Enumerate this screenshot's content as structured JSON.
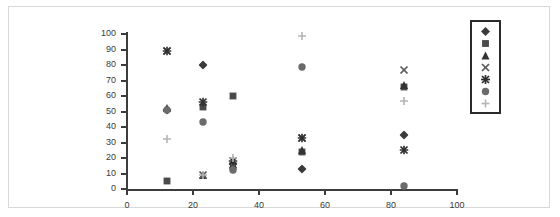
{
  "chart_data": {
    "type": "scatter",
    "title": "",
    "xlabel": "",
    "ylabel": "",
    "xlim": [
      0,
      100
    ],
    "ylim": [
      0,
      100
    ],
    "xticks": [
      0,
      20,
      40,
      60,
      80,
      100
    ],
    "yticks": [
      0,
      10,
      20,
      30,
      40,
      50,
      60,
      70,
      80,
      90,
      100
    ],
    "grid": false,
    "legend_position": "right",
    "series": [
      {
        "name": "Series 1",
        "marker": "diamond",
        "color": "#3a3a3a",
        "points": [
          {
            "x": 12,
            "y": 51
          },
          {
            "x": 23,
            "y": 80
          },
          {
            "x": 32,
            "y": 16
          },
          {
            "x": 53,
            "y": 13
          },
          {
            "x": 84,
            "y": 35
          }
        ]
      },
      {
        "name": "Series 2",
        "marker": "square",
        "color": "#4a4a4a",
        "points": [
          {
            "x": 12,
            "y": 5
          },
          {
            "x": 23,
            "y": 53
          },
          {
            "x": 32,
            "y": 60
          },
          {
            "x": 53,
            "y": 24
          },
          {
            "x": 84,
            "y": 66
          }
        ]
      },
      {
        "name": "Series 3",
        "marker": "triangle",
        "color": "#333333",
        "points": [
          {
            "x": 12,
            "y": 52
          },
          {
            "x": 23,
            "y": 9
          },
          {
            "x": 32,
            "y": 16
          },
          {
            "x": 53,
            "y": 25
          },
          {
            "x": 84,
            "y": 67
          }
        ]
      },
      {
        "name": "Series 4",
        "marker": "x-cross",
        "color": "#5a5a5a",
        "points": [
          {
            "x": 12,
            "y": 89
          },
          {
            "x": 23,
            "y": 9
          },
          {
            "x": 32,
            "y": 15
          },
          {
            "x": 53,
            "y": 33
          },
          {
            "x": 84,
            "y": 77
          }
        ]
      },
      {
        "name": "Series 5",
        "marker": "star",
        "color": "#2e2e2e",
        "points": [
          {
            "x": 12,
            "y": 89
          },
          {
            "x": 23,
            "y": 56
          },
          {
            "x": 32,
            "y": 18
          },
          {
            "x": 53,
            "y": 33
          },
          {
            "x": 84,
            "y": 25
          }
        ]
      },
      {
        "name": "Series 6",
        "marker": "circle",
        "color": "#6b6b6b",
        "points": [
          {
            "x": 12,
            "y": 51
          },
          {
            "x": 23,
            "y": 43
          },
          {
            "x": 32,
            "y": 12
          },
          {
            "x": 53,
            "y": 79
          },
          {
            "x": 84,
            "y": 2
          }
        ]
      },
      {
        "name": "Series 7",
        "marker": "plus",
        "color": "#b4b4b4",
        "points": [
          {
            "x": 12,
            "y": 32
          },
          {
            "x": 23,
            "y": 9
          },
          {
            "x": 32,
            "y": 20
          },
          {
            "x": 53,
            "y": 99
          },
          {
            "x": 84,
            "y": 57
          }
        ]
      }
    ]
  },
  "legend": {
    "items": [
      {
        "marker": "diamond",
        "label": ""
      },
      {
        "marker": "square",
        "label": ""
      },
      {
        "marker": "triangle",
        "label": ""
      },
      {
        "marker": "x-cross",
        "label": ""
      },
      {
        "marker": "star",
        "label": ""
      },
      {
        "marker": "circle",
        "label": ""
      },
      {
        "marker": "plus",
        "label": ""
      }
    ]
  }
}
